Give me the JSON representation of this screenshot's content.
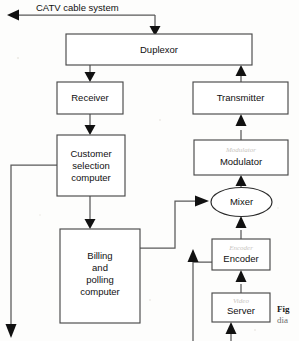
{
  "figure": {
    "type": "block-diagram",
    "background_color": "#fdfdfc",
    "line_color": "#595959",
    "box_fill": "#ffffff",
    "box_stroke": "#4a4a4a",
    "text_color": "#101010"
  },
  "nodes": [
    {
      "id": "duplexor",
      "label": "Duplexor",
      "shape": "rect",
      "x": 66,
      "y": 34,
      "w": 186,
      "h": 31
    },
    {
      "id": "receiver",
      "label": "Receiver",
      "shape": "rect",
      "x": 57,
      "y": 82,
      "w": 66,
      "h": 32
    },
    {
      "id": "transmitter",
      "label": "Transmitter",
      "shape": "rect",
      "x": 193,
      "y": 82,
      "w": 95,
      "h": 32
    },
    {
      "id": "customer",
      "label": "Customer selection computer",
      "label_lines": [
        "Customer",
        "selection",
        "computer"
      ],
      "shape": "rect",
      "x": 57,
      "y": 135,
      "w": 68,
      "h": 61
    },
    {
      "id": "modulator",
      "label": "Modulator",
      "shape": "rect",
      "x": 194,
      "y": 140,
      "w": 94,
      "h": 35
    },
    {
      "id": "mixer",
      "label": "Mixer",
      "shape": "ellipse",
      "x": 211,
      "y": 188,
      "w": 61,
      "h": 29
    },
    {
      "id": "billing",
      "label": "Billing and polling computer",
      "label_lines": [
        "Billing",
        "and",
        "polling",
        "computer"
      ],
      "shape": "rect",
      "x": 60,
      "y": 229,
      "w": 80,
      "h": 94
    },
    {
      "id": "encoder",
      "label": "Encoder",
      "shape": "rect",
      "x": 212,
      "y": 239,
      "w": 58,
      "h": 31
    },
    {
      "id": "server",
      "label": "Server",
      "shape": "rect",
      "x": 212,
      "y": 293,
      "w": 58,
      "h": 29
    }
  ],
  "ghost_labels": [
    {
      "for": "modulator",
      "text": "Modulator"
    },
    {
      "for": "encoder",
      "text": "Encoder"
    },
    {
      "for": "server",
      "text": "Video"
    }
  ],
  "edges": [
    {
      "id": "catv-out",
      "from": "duplexor",
      "to": "cable-system-out",
      "label": "CATV cable system",
      "direction": "left"
    },
    {
      "id": "catv-in",
      "from": "cable-system-in",
      "to": "duplexor",
      "label": "",
      "direction": "down"
    },
    {
      "id": "duplexor-receiver",
      "from": "duplexor",
      "to": "receiver",
      "label": "",
      "direction": "down"
    },
    {
      "id": "transmitter-duplexor",
      "from": "transmitter",
      "to": "duplexor",
      "label": "",
      "direction": "up"
    },
    {
      "id": "receiver-customer",
      "from": "receiver",
      "to": "customer",
      "label": "",
      "direction": "down"
    },
    {
      "id": "customer-billing",
      "from": "customer",
      "to": "billing",
      "label": "",
      "direction": "down"
    },
    {
      "id": "customer-feedback",
      "from": "customer",
      "to": "subscriber-drop",
      "label": "",
      "direction": "down"
    },
    {
      "id": "billing-mixer",
      "from": "billing",
      "to": "mixer",
      "label": "",
      "direction": "right"
    },
    {
      "id": "mixer-modulator",
      "from": "mixer",
      "to": "modulator",
      "label": "",
      "direction": "up"
    },
    {
      "id": "modulator-transmitter",
      "from": "modulator",
      "to": "transmitter",
      "label": "",
      "direction": "up"
    },
    {
      "id": "encoder-mixer",
      "from": "encoder",
      "to": "mixer",
      "label": "",
      "direction": "up"
    },
    {
      "id": "server-encoder",
      "from": "server",
      "to": "encoder",
      "label": "",
      "direction": "up"
    },
    {
      "id": "external-encoder",
      "from": "external-feed",
      "to": "encoder",
      "label": "",
      "direction": "up"
    },
    {
      "id": "server-bottom-feed",
      "from": "bottom-source",
      "to": "server",
      "label": "",
      "direction": "up"
    }
  ],
  "edge_labels": {
    "catv": "CATV cable system"
  },
  "caption": {
    "bold": "Fig",
    "plain": "dia"
  }
}
